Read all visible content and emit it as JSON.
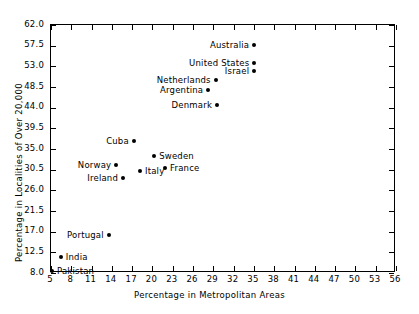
{
  "chart_data": {
    "type": "scatter",
    "title": "",
    "xlabel": "Percentage in Metropolitan Areas",
    "ylabel": "Percentage in Localities of Over 20,000",
    "xlim": [
      5,
      56
    ],
    "ylim": [
      8.0,
      62.0
    ],
    "xticks": [
      "5",
      "8",
      "11",
      "14",
      "17",
      "20",
      "23",
      "26",
      "29",
      "32",
      "35",
      "38",
      "41",
      "44",
      "47",
      "50",
      "53",
      "56"
    ],
    "yticks": [
      "8.0",
      "12.5",
      "17.0",
      "21.5",
      "26.0",
      "30.5",
      "35.0",
      "39.5",
      "44.0",
      "48.5",
      "53.0",
      "57.5",
      "62.0"
    ],
    "grid": false,
    "legend": "none",
    "marker_color": "#000000",
    "points": [
      {
        "label": "Pakistan",
        "x": 5.3,
        "y": 8.2,
        "label_side": "right"
      },
      {
        "label": "India",
        "x": 6.6,
        "y": 11.2,
        "label_side": "right"
      },
      {
        "label": "Portugal",
        "x": 13.7,
        "y": 16.0,
        "label_side": "left"
      },
      {
        "label": "Norway",
        "x": 14.8,
        "y": 31.4,
        "label_side": "left"
      },
      {
        "label": "Ireland",
        "x": 15.8,
        "y": 28.4,
        "label_side": "left"
      },
      {
        "label": "Cuba",
        "x": 17.4,
        "y": 36.6,
        "label_side": "left"
      },
      {
        "label": "Italy",
        "x": 18.3,
        "y": 29.9,
        "label_side": "right"
      },
      {
        "label": "Sweden",
        "x": 20.4,
        "y": 33.2,
        "label_side": "right"
      },
      {
        "label": "France",
        "x": 22.0,
        "y": 30.6,
        "label_side": "right"
      },
      {
        "label": "Argentina",
        "x": 28.4,
        "y": 47.6,
        "label_side": "left"
      },
      {
        "label": "Netherlands",
        "x": 29.5,
        "y": 49.8,
        "label_side": "left"
      },
      {
        "label": "Denmark",
        "x": 29.7,
        "y": 44.4,
        "label_side": "left"
      },
      {
        "label": "Israel",
        "x": 35.2,
        "y": 51.8,
        "label_side": "left"
      },
      {
        "label": "United States",
        "x": 35.2,
        "y": 53.5,
        "label_side": "left"
      },
      {
        "label": "Australia",
        "x": 35.2,
        "y": 57.4,
        "label_side": "left"
      }
    ]
  }
}
